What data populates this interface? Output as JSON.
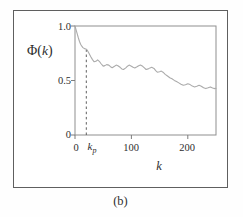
{
  "figure": {
    "caption": "(b)",
    "y_axis": {
      "label_pre": "Φ(",
      "label_var": "k",
      "label_post": ")",
      "ticks": [
        {
          "value": 1.0,
          "label": "1.0"
        },
        {
          "value": 0.5,
          "label": "0.5"
        },
        {
          "value": 0.0,
          "label": "0"
        }
      ]
    },
    "x_axis": {
      "label": "k",
      "ticks": [
        {
          "value": 0,
          "label": "0"
        },
        {
          "value": 100,
          "label": "100"
        },
        {
          "value": 200,
          "label": "200"
        }
      ],
      "kp_marker": {
        "base": "k",
        "sub": "p"
      }
    }
  },
  "colors": {
    "curve": "#ababab",
    "frame": "#8f8f8f",
    "tick": "#7d7d7d",
    "dashed_marker": "#5e5e5e",
    "panel_border": "#5f5f5f",
    "text": "#2e2e2e"
  },
  "chart_data": {
    "type": "line",
    "title": "",
    "xlabel": "k",
    "ylabel": "Φ(k)",
    "xlim": [
      0,
      250
    ],
    "ylim": [
      0,
      1.0
    ],
    "x_ticks": [
      0,
      100,
      200
    ],
    "y_ticks": [
      0,
      0.5,
      1.0
    ],
    "grid": false,
    "legend": "none",
    "annotations": [
      {
        "type": "vline_dashed",
        "x": 20,
        "y_from": 0,
        "y_to": 0.78,
        "label": "kp"
      }
    ],
    "kp": {
      "x": 20,
      "top": 0.78
    },
    "series": [
      {
        "name": "Φ(k)",
        "x": [
          0,
          2,
          4,
          6,
          8,
          10,
          12,
          14,
          16,
          18,
          20,
          22,
          25,
          28,
          31,
          34,
          37,
          40,
          43,
          46,
          50,
          53,
          56,
          60,
          63,
          66,
          70,
          73,
          76,
          80,
          83,
          86,
          90,
          93,
          96,
          100,
          103,
          106,
          110,
          113,
          116,
          120,
          123,
          126,
          130,
          133,
          136,
          140,
          143,
          146,
          150,
          153,
          156,
          160,
          164,
          168,
          172,
          176,
          180,
          184,
          188,
          192,
          196,
          200,
          204,
          208,
          212,
          216,
          220,
          224,
          228,
          232,
          236,
          240,
          244,
          248,
          250
        ],
        "y": [
          1.0,
          0.965,
          0.925,
          0.89,
          0.858,
          0.833,
          0.815,
          0.802,
          0.795,
          0.79,
          0.787,
          0.776,
          0.748,
          0.718,
          0.692,
          0.672,
          0.676,
          0.69,
          0.676,
          0.656,
          0.632,
          0.637,
          0.646,
          0.641,
          0.627,
          0.617,
          0.63,
          0.641,
          0.636,
          0.621,
          0.606,
          0.601,
          0.616,
          0.631,
          0.641,
          0.631,
          0.621,
          0.616,
          0.626,
          0.636,
          0.641,
          0.63,
          0.616,
          0.601,
          0.606,
          0.616,
          0.621,
          0.611,
          0.591,
          0.576,
          0.581,
          0.586,
          0.576,
          0.556,
          0.541,
          0.526,
          0.516,
          0.501,
          0.491,
          0.478,
          0.466,
          0.456,
          0.461,
          0.471,
          0.462,
          0.449,
          0.441,
          0.448,
          0.456,
          0.448,
          0.433,
          0.426,
          0.433,
          0.441,
          0.431,
          0.426,
          0.428
        ]
      }
    ]
  }
}
